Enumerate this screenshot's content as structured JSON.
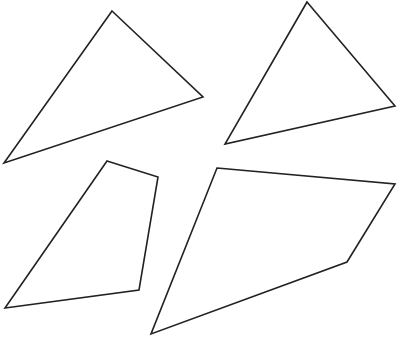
{
  "canvas": {
    "width": 398,
    "height": 337,
    "background": "#ffffff",
    "stroke_color": "#222222"
  },
  "shapes": [
    {
      "id": "triangle-top-left",
      "type": "triangle",
      "points": "112,11 203,97 4,163"
    },
    {
      "id": "triangle-top-right",
      "type": "triangle",
      "points": "307,2 395,106 225,144"
    },
    {
      "id": "quadrilateral-bottom-left",
      "type": "quadrilateral",
      "points": "107,161 158,177 139,290 5,308"
    },
    {
      "id": "quadrilateral-bottom-right",
      "type": "quadrilateral",
      "points": "217,168 395,184 347,262 151,334"
    }
  ]
}
